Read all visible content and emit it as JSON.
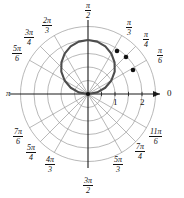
{
  "figure": {
    "kind": "polar-plot",
    "background": "#ffffff",
    "curve_color": "#4d4d4d",
    "grid_color": "#9a9a9a",
    "axis_color": "#1a1a1a",
    "point_color": "#111111"
  },
  "axis_labels": {
    "right": "0",
    "left": "π"
  },
  "radial_ticks": [
    {
      "label": "1",
      "value": 1
    },
    {
      "label": "2",
      "value": 2
    }
  ],
  "angle_labels": [
    {
      "id": "pi-over-2",
      "num": "π",
      "den": "2",
      "value_deg": 90,
      "x": 85,
      "y": 1
    },
    {
      "id": "2pi-over-3",
      "num": "2π",
      "den": "3",
      "value_deg": 120,
      "x": 42,
      "y": 16
    },
    {
      "id": "3pi-over-4",
      "num": "3π",
      "den": "4",
      "value_deg": 135,
      "x": 24,
      "y": 28
    },
    {
      "id": "5pi-over-6",
      "num": "5π",
      "den": "6",
      "value_deg": 150,
      "x": 12,
      "y": 44
    },
    {
      "id": "pi-over-3",
      "num": "π",
      "den": "3",
      "value_deg": 60,
      "x": 126,
      "y": 18
    },
    {
      "id": "pi-over-4",
      "num": "π",
      "den": "4",
      "value_deg": 45,
      "x": 143,
      "y": 30
    },
    {
      "id": "pi-over-6",
      "num": "π",
      "den": "6",
      "value_deg": 30,
      "x": 157,
      "y": 46
    },
    {
      "id": "7pi-over-6",
      "num": "7π",
      "den": "6",
      "value_deg": 210,
      "x": 13,
      "y": 127
    },
    {
      "id": "5pi-over-4",
      "num": "5π",
      "den": "4",
      "value_deg": 225,
      "x": 26,
      "y": 143
    },
    {
      "id": "4pi-over-3",
      "num": "4π",
      "den": "3",
      "value_deg": 240,
      "x": 45,
      "y": 155
    },
    {
      "id": "5pi-over-3",
      "num": "5π",
      "den": "3",
      "value_deg": 300,
      "x": 113,
      "y": 155
    },
    {
      "id": "7pi-over-4",
      "num": "7π",
      "den": "4",
      "value_deg": 315,
      "x": 135,
      "y": 142
    },
    {
      "id": "11pi-over-6",
      "num": "11π",
      "den": "6",
      "value_deg": 330,
      "x": 149,
      "y": 127
    },
    {
      "id": "3pi-over-2",
      "num": "3π",
      "den": "2",
      "value_deg": 270,
      "x": 83,
      "y": 176
    }
  ],
  "chart_data": {
    "type": "line",
    "coordinate_system": "polar",
    "title": "",
    "xlabel": "",
    "ylabel": "",
    "grid": true,
    "legend": null,
    "origin_px": {
      "x": 88,
      "y": 94
    },
    "pixels_per_unit": 27,
    "radial_range": [
      0,
      2.5
    ],
    "radial_gridlines": [
      0.5,
      1.0,
      1.5,
      2.0,
      2.5
    ],
    "angular_gridlines_deg": [
      0,
      30,
      45,
      60,
      90,
      120,
      135,
      150,
      180,
      210,
      225,
      240,
      270,
      300,
      315,
      330
    ],
    "angle_tick_labels": [
      "0",
      "π/6",
      "π/4",
      "π/3",
      "π/2",
      "2π/3",
      "3π/4",
      "5π/6",
      "π",
      "7π/6",
      "5π/4",
      "4π/3",
      "3π/2",
      "5π/3",
      "7π/4",
      "11π/6"
    ],
    "series": [
      {
        "name": "polar-curve",
        "color": "#4d4d4d",
        "theta_deg_range": [
          0,
          180
        ],
        "r_of_theta": "r = 2 * sin(theta)",
        "points_polar": [
          {
            "theta_deg": 0,
            "r": 0.0
          },
          {
            "theta_deg": 10,
            "r": 0.35
          },
          {
            "theta_deg": 20,
            "r": 0.68
          },
          {
            "theta_deg": 30,
            "r": 1.0
          },
          {
            "theta_deg": 40,
            "r": 1.29
          },
          {
            "theta_deg": 50,
            "r": 1.53
          },
          {
            "theta_deg": 60,
            "r": 1.73
          },
          {
            "theta_deg": 70,
            "r": 1.88
          },
          {
            "theta_deg": 80,
            "r": 1.97
          },
          {
            "theta_deg": 90,
            "r": 2.0
          },
          {
            "theta_deg": 100,
            "r": 1.97
          },
          {
            "theta_deg": 110,
            "r": 1.88
          },
          {
            "theta_deg": 120,
            "r": 1.73
          },
          {
            "theta_deg": 130,
            "r": 1.53
          },
          {
            "theta_deg": 140,
            "r": 1.29
          },
          {
            "theta_deg": 150,
            "r": 1.0
          },
          {
            "theta_deg": 160,
            "r": 0.68
          },
          {
            "theta_deg": 170,
            "r": 0.35
          },
          {
            "theta_deg": 180,
            "r": 0.0
          }
        ]
      }
    ],
    "marked_points": [
      {
        "label": "",
        "theta_deg": 78,
        "r": 1.96,
        "px": {
          "x": 117,
          "y": 51
        }
      },
      {
        "label": "",
        "theta_deg": 64,
        "r": 1.8,
        "px": {
          "x": 126,
          "y": 57
        }
      },
      {
        "label": "",
        "theta_deg": 45,
        "r": 1.41,
        "px": {
          "x": 133,
          "y": 70
        }
      }
    ]
  }
}
